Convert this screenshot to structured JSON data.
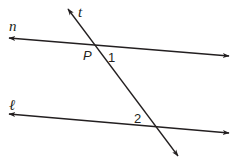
{
  "diagram": {
    "lines": [
      {
        "name": "n",
        "label": "n",
        "x1": 9,
        "y1": 38,
        "x2": 229,
        "y2": 56
      },
      {
        "name": "l",
        "label": "ℓ",
        "x1": 9,
        "y1": 114,
        "x2": 229,
        "y2": 133
      },
      {
        "name": "t",
        "label": "t",
        "x1": 68,
        "y1": 9,
        "x2": 178,
        "y2": 156
      }
    ],
    "labels": {
      "n": "n",
      "l": "ℓ",
      "t": "t",
      "point": "P",
      "angle1": "1",
      "angle2": "2"
    },
    "colors": {
      "stroke": "#231f20",
      "background": "#ffffff"
    }
  }
}
